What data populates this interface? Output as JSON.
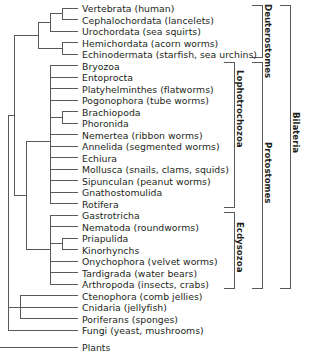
{
  "diagram": {
    "type": "phylogenetic-tree",
    "orientation": "left-to-right",
    "stroke_color": "#58595b",
    "text_color": "#231f20"
  },
  "taxa": [
    {
      "id": "vertebrata",
      "label": "Vertebrata (human)"
    },
    {
      "id": "cephalochordata",
      "label": "Cephalochordata (lancelets)"
    },
    {
      "id": "urochordata",
      "label": "Urochordata (sea squirts)"
    },
    {
      "id": "hemichordata",
      "label": "Hemichordata (acorn worms)"
    },
    {
      "id": "echinodermata",
      "label": "Echinodermata (starfish, sea urchins)"
    },
    {
      "id": "bryozoa",
      "label": "Bryozoa"
    },
    {
      "id": "entoprocta",
      "label": "Entoprocta"
    },
    {
      "id": "platyhelminthes",
      "label": "Platyhelminthes (flatworms)"
    },
    {
      "id": "pogonophora",
      "label": "Pogonophora (tube worms)"
    },
    {
      "id": "brachiopoda",
      "label": "Brachiopoda"
    },
    {
      "id": "phoronida",
      "label": "Phoronida"
    },
    {
      "id": "nemertea",
      "label": "Nemertea (ribbon worms)"
    },
    {
      "id": "annelida",
      "label": "Annelida (segmented worms)"
    },
    {
      "id": "echiura",
      "label": "Echiura"
    },
    {
      "id": "mollusca",
      "label": "Mollusca (snails, clams, squids)"
    },
    {
      "id": "sipunculan",
      "label": "Sipunculan (peanut worms)"
    },
    {
      "id": "gnathostomulida",
      "label": "Gnathostomulida"
    },
    {
      "id": "rotifera",
      "label": "Rotifera"
    },
    {
      "id": "gastrotricha",
      "label": "Gastrotricha"
    },
    {
      "id": "nematoda",
      "label": "Nematoda (roundworms)"
    },
    {
      "id": "priapulida",
      "label": "Priapulida"
    },
    {
      "id": "kinorhynchs",
      "label": "Kinorhynchs"
    },
    {
      "id": "onychophora",
      "label": "Onychophora (velvet worms)"
    },
    {
      "id": "tardigrada",
      "label": "Tardigrada (water bears)"
    },
    {
      "id": "arthropoda",
      "label": "Arthropoda (insects, crabs)"
    },
    {
      "id": "ctenophora",
      "label": "Ctenophora (comb jellies)"
    },
    {
      "id": "cnidaria",
      "label": "Cnidaria (jellyfish)"
    },
    {
      "id": "poriferans",
      "label": "Poriferans (sponges)"
    },
    {
      "id": "fungi",
      "label": "Fungi (yeast, mushrooms)"
    },
    {
      "id": "plants",
      "label": "Plants"
    }
  ],
  "clades": [
    {
      "id": "deuterostomes",
      "label": "Deuterostomes"
    },
    {
      "id": "lophotrochozoa",
      "label": "Lophotrochozoa"
    },
    {
      "id": "ecdysozoa",
      "label": "Ecdysozoa"
    },
    {
      "id": "protostomes",
      "label": "Protostomes"
    },
    {
      "id": "bilateria",
      "label": "Bilateria"
    }
  ]
}
